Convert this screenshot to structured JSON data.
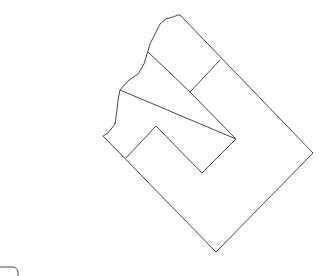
{
  "diagram": {
    "type": "parcel-line-drawing",
    "stroke_color": "#4a4a4a",
    "background": "#ffffff",
    "outer_boundary": [
      [
        178,
        15
      ],
      [
        313,
        153
      ],
      [
        216,
        252
      ],
      [
        103,
        136
      ],
      [
        108,
        132
      ],
      [
        116,
        122
      ],
      [
        118,
        100
      ],
      [
        120,
        90
      ],
      [
        128,
        80
      ],
      [
        140,
        72
      ],
      [
        145,
        62
      ],
      [
        148,
        52
      ],
      [
        155,
        35
      ],
      [
        162,
        22
      ],
      [
        170,
        18
      ],
      [
        178,
        15
      ]
    ],
    "inner_block": [
      [
        120,
        90
      ],
      [
        236,
        139
      ],
      [
        202,
        173
      ],
      [
        156,
        126
      ]
    ],
    "inner_block_path": [
      [
        120,
        90
      ],
      [
        236,
        139
      ],
      [
        202,
        173
      ],
      [
        120,
        90
      ]
    ],
    "divider_lines": [
      [
        [
          148,
          52
        ],
        [
          190,
          92
        ]
      ],
      [
        [
          190,
          92
        ],
        [
          220,
          60
        ]
      ],
      [
        [
          156,
          126
        ],
        [
          126,
          158
        ]
      ]
    ],
    "corner_fragment": [
      [
        0,
        266
      ],
      [
        14,
        266
      ],
      [
        18,
        270
      ],
      [
        18,
        276
      ]
    ]
  }
}
